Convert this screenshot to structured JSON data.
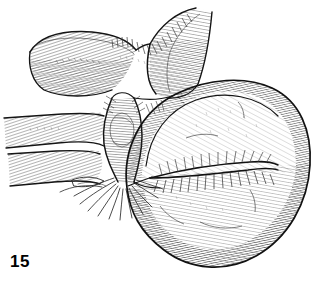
{
  "figure": {
    "number": "15",
    "caption": "",
    "type": "anatomical-line-illustration",
    "medium": "pen-and-ink cross-hatching",
    "background_color": "#ffffff",
    "ink_color": "#1a1a1a",
    "hatch_color": "#3a3a3a",
    "canvas": {
      "width": 327,
      "height": 296
    }
  },
  "drawing": {
    "title": "Hatched anatomical line drawing of a rounded organ mass with stalk and tubular branches",
    "parts": [
      {
        "id": "upper-left-tube",
        "label": "upper left tubular limb",
        "description": "Broad tube running diagonally from upper-left toward the central junction, rendered with dense parallel comb hatching on its lower face.",
        "bounds": {
          "x": 26,
          "y": 30,
          "width": 100,
          "height": 66
        }
      },
      {
        "id": "upper-right-tube",
        "label": "upper right tubular limb",
        "description": "Tube rising to the top edge of the frame, meeting the left limb in a V-shaped notch; hatched along its left flank.",
        "bounds": {
          "x": 130,
          "y": 8,
          "width": 78,
          "height": 90
        }
      },
      {
        "id": "v-notch",
        "label": "V-shaped junction notch",
        "description": "Concave saddle where the two upper tubular limbs converge above the stalk.",
        "bounds": {
          "x": 110,
          "y": 22,
          "width": 66,
          "height": 40
        }
      },
      {
        "id": "central-stalk",
        "label": "central neck / stalk",
        "description": "Narrow hourglass-shaped pedicle connecting the upper tubes to the large mass, banded with fine horizontal hatching.",
        "bounds": {
          "x": 98,
          "y": 96,
          "width": 48,
          "height": 88
        }
      },
      {
        "id": "left-mid-branch",
        "label": "left middle tubular branch",
        "description": "Tube extending to the left frame edge with comb-like hatching along its upper surface.",
        "bounds": {
          "x": 4,
          "y": 110,
          "width": 104,
          "height": 40
        }
      },
      {
        "id": "left-lower-branch",
        "label": "left lower tubular branch",
        "description": "Second, shorter tube below the middle branch reaching the left frame edge, also comb-hatched.",
        "bounds": {
          "x": 6,
          "y": 146,
          "width": 96,
          "height": 40
        }
      },
      {
        "id": "fibrous-strands",
        "label": "radiating fibrous strands",
        "description": "Fan of fine curved strands spreading outward from the base of the stalk toward the lower left.",
        "bounds": {
          "x": 60,
          "y": 160,
          "width": 90,
          "height": 52
        }
      },
      {
        "id": "main-mass",
        "label": "large rounded organ mass",
        "description": "Dominant bulbous body occupying the right two thirds of the frame, outlined with a heavy contour and modelled with dense directional hatching.",
        "bounds": {
          "x": 120,
          "y": 76,
          "width": 190,
          "height": 192
        }
      },
      {
        "id": "mass-cleft",
        "label": "horizontal fold / cleft",
        "description": "Deep horizontal groove crossing the middle of the mass, with hatching radiating away from it on both sides.",
        "bounds": {
          "x": 150,
          "y": 150,
          "width": 125,
          "height": 30
        }
      },
      {
        "id": "mass-upper-lobe",
        "label": "upper lobe of mass",
        "description": "Smooth, lightly hatched dome above the cleft.",
        "bounds": {
          "x": 150,
          "y": 80,
          "width": 160,
          "height": 80
        }
      },
      {
        "id": "mass-lower-lobe",
        "label": "lower lobe of mass",
        "description": "Heavier, more densely hatched rounded lower portion below the cleft.",
        "bounds": {
          "x": 128,
          "y": 165,
          "width": 175,
          "height": 100
        }
      }
    ]
  }
}
